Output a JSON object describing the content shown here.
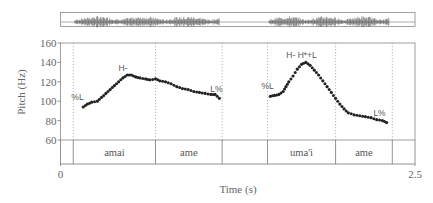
{
  "chart_data": {
    "type": "scatter",
    "title": "",
    "xlabel": "Time (s)",
    "ylabel": "Pitch (Hz)",
    "xlim": [
      0,
      2.5
    ],
    "ylim": [
      60,
      160
    ],
    "x_ticks": [
      "0",
      "2.5"
    ],
    "y_ticks": [
      "60",
      "80",
      "100",
      "120",
      "140",
      "160"
    ],
    "grid": false,
    "waveform_segments": [
      [
        0.1,
        1.12
      ],
      [
        1.47,
        2.32
      ]
    ],
    "boundaries_s": [
      0.09,
      0.67,
      1.14,
      1.46,
      1.94,
      2.34
    ],
    "word_tier": [
      {
        "label": "amai",
        "start": 0.09,
        "end": 0.67
      },
      {
        "label": "ame",
        "start": 0.67,
        "end": 1.14
      },
      {
        "label": "",
        "start": 1.14,
        "end": 1.46
      },
      {
        "label": "uma'i",
        "start": 1.46,
        "end": 1.94
      },
      {
        "label": "ame",
        "start": 1.94,
        "end": 2.34
      },
      {
        "label": "",
        "start": 2.34,
        "end": 2.5
      }
    ],
    "annotations": [
      {
        "text": "%L",
        "t": 0.12,
        "hz": 101
      },
      {
        "text": "H-",
        "t": 0.44,
        "hz": 131
      },
      {
        "text": "L%",
        "t": 1.1,
        "hz": 110
      },
      {
        "text": "%L",
        "t": 1.46,
        "hz": 113
      },
      {
        "text": "H- H*+L",
        "t": 1.7,
        "hz": 145
      },
      {
        "text": "L%",
        "t": 2.25,
        "hz": 85
      }
    ],
    "series": [
      {
        "name": "Pitch contour 1",
        "x": [
          0.16,
          0.19,
          0.22,
          0.26,
          0.29,
          0.32,
          0.35,
          0.38,
          0.41,
          0.44,
          0.47,
          0.5,
          0.53,
          0.56,
          0.6,
          0.63,
          0.67,
          0.7,
          0.74,
          0.78,
          0.82,
          0.86,
          0.9,
          0.94,
          0.98,
          1.02,
          1.06,
          1.09,
          1.12
        ],
        "y": [
          94,
          97,
          99,
          100,
          104,
          108,
          112,
          116,
          120,
          124,
          127,
          127,
          125,
          124,
          123,
          122,
          123,
          121,
          120,
          118,
          115,
          113,
          112,
          110,
          109,
          108,
          107,
          107,
          103
        ]
      },
      {
        "name": "Pitch contour 2",
        "x": [
          1.48,
          1.51,
          1.54,
          1.57,
          1.59,
          1.61,
          1.64,
          1.67,
          1.7,
          1.73,
          1.76,
          1.79,
          1.82,
          1.85,
          1.88,
          1.91,
          1.94,
          1.97,
          2.0,
          2.03,
          2.07,
          2.11,
          2.15,
          2.19,
          2.23,
          2.27,
          2.3
        ],
        "y": [
          105,
          106,
          107,
          110,
          115,
          120,
          126,
          133,
          138,
          140,
          137,
          132,
          127,
          121,
          115,
          109,
          103,
          97,
          92,
          88,
          86,
          85,
          84,
          83,
          81,
          80,
          78
        ]
      }
    ]
  }
}
